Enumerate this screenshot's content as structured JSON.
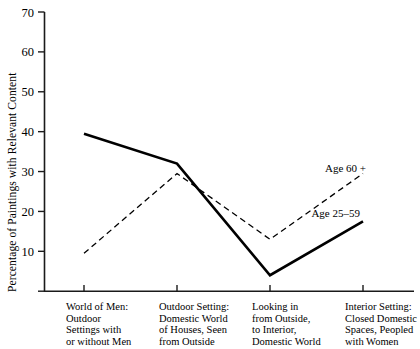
{
  "chart_data": {
    "type": "line",
    "title": "",
    "xlabel": "",
    "ylabel": "Percentage of Paintings with Relevant Content",
    "ylim": [
      0,
      70
    ],
    "yticks": [
      0,
      10,
      20,
      30,
      40,
      50,
      60,
      70
    ],
    "ytick_labels": [
      "",
      "10",
      "20",
      "30",
      "40",
      "50",
      "60",
      "70"
    ],
    "grid": false,
    "legend_position": "inline-right",
    "categories": [
      "World of Men: Outdoor Settings with or without Men",
      "Outdoor Setting: Domestic World of Houses, Seen from Outside",
      "Looking in from Outside, to Interior, Domestic World",
      "Interior Setting: Closed Domestic Spaces, Peopled with Women"
    ],
    "category_lines": [
      [
        "World of Men:",
        "Outdoor",
        "Settings with",
        "or without Men"
      ],
      [
        "Outdoor Setting:",
        "Domestic World",
        "of Houses, Seen",
        "from Outside"
      ],
      [
        "Looking in",
        "from Outside,",
        "to Interior,",
        "Domestic World"
      ],
      [
        "Interior Setting:",
        "Closed Domestic",
        "Spaces, Peopled",
        "with Women"
      ]
    ],
    "series": [
      {
        "name": "Age 25–59",
        "style": "solid",
        "color": "#000000",
        "values": [
          39.5,
          32,
          4,
          17.5
        ]
      },
      {
        "name": "Age 60 +",
        "style": "dashed",
        "color": "#000000",
        "values": [
          9.5,
          29.5,
          13,
          29.5
        ]
      }
    ],
    "annotations": [
      {
        "text": "Age 60 +",
        "x": 366,
        "y": 172
      },
      {
        "text": "Age 25–59",
        "x": 360,
        "y": 217
      }
    ]
  },
  "axis": {
    "y_title": "Percentage of Paintings with Relevant Content"
  }
}
